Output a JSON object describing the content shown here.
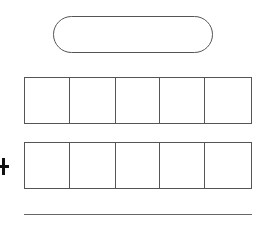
{
  "worksheet": {
    "answer_pill": {
      "value": ""
    },
    "operator": {
      "symbol": "+",
      "icon": "plus-icon"
    },
    "row1": {
      "cells": [
        "",
        "",
        "",
        "",
        ""
      ]
    },
    "row2": {
      "cells": [
        "",
        "",
        "",
        "",
        ""
      ]
    },
    "result_line": {
      "value": ""
    }
  }
}
